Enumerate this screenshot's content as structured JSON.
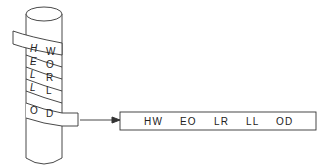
{
  "diagram": {
    "type": "scytale-cipher",
    "wrapped_rows": [
      {
        "left": "H",
        "right": "W"
      },
      {
        "left": "E",
        "right": "O"
      },
      {
        "left": "L",
        "right": "R"
      },
      {
        "left": "L",
        "right": "L"
      },
      {
        "left": "O",
        "right": "D"
      }
    ],
    "output_strip": {
      "groups": [
        "HW",
        "EO",
        "LR",
        "LL",
        "OD"
      ],
      "text": "HW   EO   LR   LL   OD"
    },
    "colors": {
      "stroke": "#333333",
      "background": "#ffffff",
      "text": "#222222"
    }
  }
}
